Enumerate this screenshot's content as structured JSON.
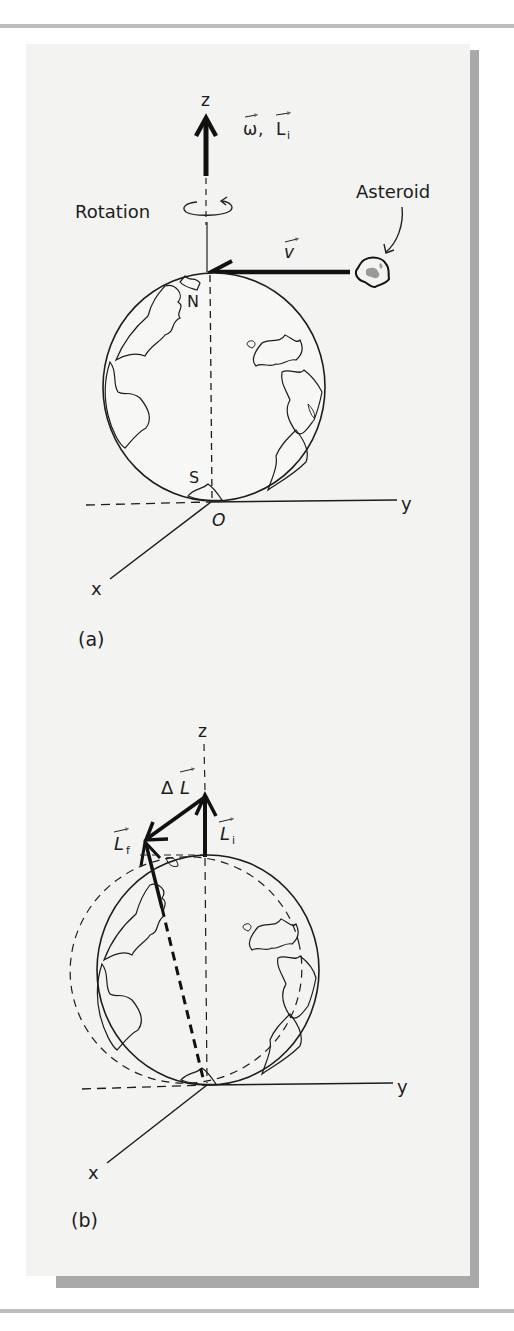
{
  "figure": {
    "panel_background": "#f3f3f2",
    "frame_shadow": "#a9a9a9",
    "ink_color": "#1c1c1c",
    "asteroid_fill": "#9a9a9a",
    "panel_a": {
      "caption": "(a)",
      "axis_z_label": "z",
      "axis_y_label": "y",
      "axis_x_label": "x",
      "origin_label": "O",
      "vector_label_omega": "ω",
      "vector_label_sep": ",",
      "vector_label_L": "L",
      "vector_label_L_sub": "i",
      "rotation_label": "Rotation",
      "asteroid_label": "Asteroid",
      "velocity_label": "v",
      "north_label": "N",
      "south_label": "S"
    },
    "panel_b": {
      "caption": "(b)",
      "axis_z_label": "z",
      "axis_y_label": "y",
      "axis_x_label": "x",
      "delta_label": "Δ",
      "L_label": "L",
      "L_initial_sub": "i",
      "L_final_sub": "f"
    }
  }
}
